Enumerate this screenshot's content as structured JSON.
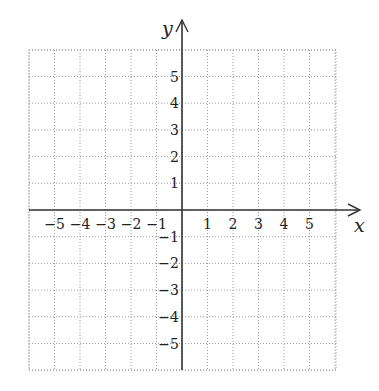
{
  "chart_data": {
    "type": "scatter",
    "title": "",
    "xlabel": "x",
    "ylabel": "y",
    "xlim": [
      -6,
      6
    ],
    "ylim": [
      -6,
      6
    ],
    "grid": true,
    "grid_style": "dotted",
    "x_ticks": [
      -5,
      -4,
      -3,
      -2,
      -1,
      1,
      2,
      3,
      4,
      5
    ],
    "y_ticks": [
      -5,
      -4,
      -3,
      -2,
      -1,
      1,
      2,
      3,
      4,
      5
    ],
    "x_tick_labels": [
      "−5",
      "−4",
      "−3",
      "−2",
      "−1",
      "1",
      "2",
      "3",
      "4",
      "5"
    ],
    "y_tick_labels": [
      "−5",
      "−4",
      "−3",
      "−2",
      "−1",
      "1",
      "2",
      "3",
      "4",
      "5"
    ],
    "series": [],
    "legend": null
  },
  "colors": {
    "axis": "#333333",
    "grid": "#9a9a9a",
    "text": "#222222",
    "background": "#ffffff"
  },
  "geometry": {
    "origin_x": 182,
    "origin_y": 210,
    "unit_x": 25.5,
    "unit_y": 26.7,
    "grid_left": 29,
    "grid_right": 336,
    "grid_top": 50,
    "grid_bottom": 370,
    "x_arrow_end": 360,
    "y_arrow_end": 20
  }
}
